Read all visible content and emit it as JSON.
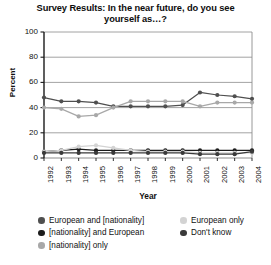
{
  "title": "Survey Results: In the near future, do you see yourself as…?",
  "title_line1": "Survey Results: In the near future, do you see",
  "title_line2": "yourself as…?",
  "axes": {
    "ylabel": "Percent",
    "xlabel": "Year",
    "yticks": [
      "100",
      "80",
      "60",
      "40",
      "20",
      "0"
    ],
    "xticks": [
      "1992",
      "1993",
      "1994",
      "1995",
      "1996",
      "1997",
      "1998",
      "1999",
      "2000",
      "2001",
      "2002",
      "2003",
      "2004"
    ]
  },
  "legend": {
    "left": [
      {
        "label": "European and [nationality]",
        "color": "#4f4f4f"
      },
      {
        "label": "[nationality] and European",
        "color": "#1c1c1c"
      },
      {
        "label": "[nationality] only",
        "color": "#a8a8a8"
      }
    ],
    "right": [
      {
        "label": "European only",
        "color": "#d3d3d3"
      },
      {
        "label": "Don't know",
        "color": "#3a3a3a"
      }
    ]
  },
  "chart_data": {
    "type": "line",
    "title": "Survey Results: In the near future, do you see yourself as…?",
    "xlabel": "Year",
    "ylabel": "Percent",
    "ylim": [
      0,
      100
    ],
    "ytick_step": 20,
    "grid": true,
    "legend_position": "bottom",
    "x": [
      1992,
      1993,
      1994,
      1995,
      1996,
      1997,
      1998,
      1999,
      2000,
      2001,
      2002,
      2003,
      2004
    ],
    "series": [
      {
        "name": "European and [nationality]",
        "color": "#4f4f4f",
        "values": [
          48,
          45,
          45,
          44,
          41,
          41,
          41,
          41,
          42,
          52,
          50,
          49,
          47
        ]
      },
      {
        "name": "[nationality] and European",
        "color": "#1c1c1c",
        "values": [
          5,
          6,
          7,
          6,
          6,
          6,
          6,
          6,
          6,
          6,
          6,
          6,
          6
        ]
      },
      {
        "name": "[nationality] only",
        "color": "#a8a8a8",
        "values": [
          40,
          39,
          33,
          34,
          40,
          45,
          45,
          45,
          45,
          41,
          44,
          44,
          44
        ]
      },
      {
        "name": "European only",
        "color": "#d3d3d3",
        "values": [
          5,
          6,
          9,
          10,
          8,
          6,
          5,
          5,
          5,
          4,
          4,
          4,
          4
        ]
      },
      {
        "name": "Don't know",
        "color": "#3a3a3a",
        "values": [
          4,
          4,
          4,
          4,
          4,
          4,
          4,
          4,
          4,
          3,
          3,
          3,
          5
        ]
      }
    ]
  },
  "plot_geometry": {
    "left": 44,
    "right": 252,
    "top": 32,
    "bottom": 158
  }
}
